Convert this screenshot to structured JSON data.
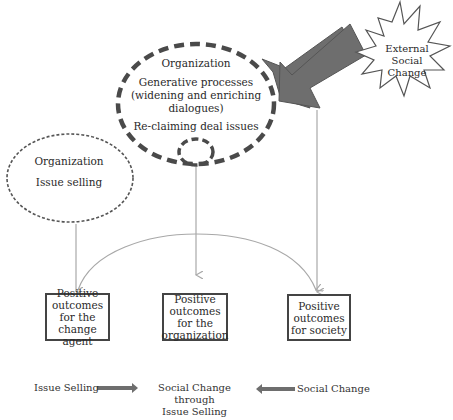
{
  "organization_main": {
    "title": "Organization",
    "line1": "Generative processes",
    "line2": "(widening and enriching",
    "line3": "dialogues)",
    "line4": "Re-claiming deal issues"
  },
  "organization_left": {
    "title": "Organization",
    "subtitle": "Issue selling"
  },
  "external": {
    "line1": "External",
    "line2": "Social",
    "line3": "Change"
  },
  "outcomes": [
    {
      "text": "Positive outcomes for the change agent"
    },
    {
      "text": "Positive outcomes for the organization"
    },
    {
      "text": "Positive outcomes for society"
    }
  ],
  "legend": {
    "left": "Issue Selling",
    "middle_line1": "Social Change through",
    "middle_line2": "Issue Selling",
    "right": "Social Change"
  },
  "colors": {
    "dashed_stroke": "#4a4a4a",
    "big_arrow_fill": "#6e6e6e",
    "thin_arrow": "#a8a8a8",
    "box_border": "#444444"
  }
}
